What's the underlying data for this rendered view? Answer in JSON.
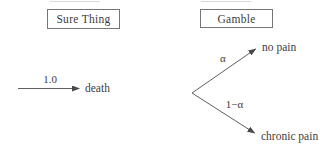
{
  "diagram": {
    "type": "decision-tree",
    "colors": {
      "background": "#ffffff",
      "line": "#5f5f5f",
      "arrowhead": "#4a4a4a",
      "text": "#3d3d3d",
      "box_border": "#767676"
    },
    "sure_thing": {
      "title": "Sure Thing",
      "probability": "1.0",
      "outcome": "death"
    },
    "gamble": {
      "title": "Gamble",
      "branches": [
        {
          "probability": "α",
          "outcome": "no pain"
        },
        {
          "probability": "1−α",
          "outcome": "chronic pain"
        }
      ]
    }
  }
}
